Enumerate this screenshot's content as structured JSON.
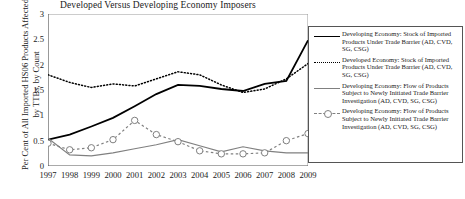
{
  "chart_data": {
    "type": "line",
    "title": "Developed Versus Developing Economy Imposers",
    "xlabel": "",
    "ylabel": "Per Cent of All Imported HS06 Products Affected by TTBs, by Count",
    "x": [
      1997,
      1998,
      1999,
      2000,
      2001,
      2002,
      2003,
      2004,
      2005,
      2006,
      2007,
      2008,
      2009
    ],
    "xlim": [
      1997,
      2009
    ],
    "ylim": [
      0,
      3
    ],
    "yticks": [
      0,
      0.5,
      1,
      1.5,
      2,
      2.5,
      3
    ],
    "ytick_labels": [
      "0",
      "0.5",
      "1",
      "1.5",
      "2",
      "2.5",
      "3"
    ],
    "xtick_labels": [
      "1997",
      "1998",
      "1999",
      "2000",
      "2001",
      "2002",
      "2003",
      "2004",
      "2005",
      "2006",
      "2007",
      "2008",
      "2009"
    ],
    "grid": false,
    "legend_position": "right-outside",
    "series": [
      {
        "name": "Developing Economy: Stock of Imported Products Under Trade Barrier (AD, CVD, SG, CSG)",
        "style": "solid",
        "color": "#000000",
        "marker": "none",
        "values": [
          0.52,
          0.62,
          0.78,
          0.95,
          1.18,
          1.42,
          1.6,
          1.58,
          1.52,
          1.48,
          1.62,
          1.68,
          2.48
        ]
      },
      {
        "name": "Developed Economy: Stock of Imported Products Under Trade Barrier (AD, CVD, SG, CSG)",
        "style": "dotted",
        "color": "#000000",
        "marker": "none",
        "values": [
          1.8,
          1.65,
          1.55,
          1.62,
          1.58,
          1.72,
          1.86,
          1.8,
          1.6,
          1.45,
          1.52,
          1.72,
          2.02
        ]
      },
      {
        "name": "Developing Economy: Flow of Products Subject to Newly Initiated Trade Barrier Investigation (AD, CVD, SG, CSG)",
        "style": "solid",
        "color": "#808080",
        "marker": "none",
        "values": [
          0.55,
          0.22,
          0.2,
          0.26,
          0.34,
          0.42,
          0.52,
          0.4,
          0.28,
          0.38,
          0.3,
          0.26,
          0.26
        ]
      },
      {
        "name": "Developing Economy: Flow of Products Subject to Newly Initiated Trade Barrier Investigation (AD, CVD, SG, CSG)",
        "style": "dashed-circle",
        "color": "#808080",
        "marker": "circle",
        "values": [
          0.45,
          0.32,
          0.36,
          0.52,
          0.9,
          0.62,
          0.48,
          0.3,
          0.24,
          0.24,
          0.26,
          0.5,
          0.64
        ]
      }
    ]
  },
  "legend": {
    "entries": [
      {
        "key": "solid-black",
        "label": "Developing Economy: Stock of Imported Products Under Trade Barrier (AD, CVD, SG, CSG)"
      },
      {
        "key": "dotted-black",
        "label": "Developed Economy: Stock of Imported Products Under Trade Barrier (AD, CVD, SG, CSG)"
      },
      {
        "key": "solid-gray",
        "label": "Developing Economy: Flow of Products Subject to Newly Initiated Trade Barrier Investigation (AD, CVD, SG, CSG)"
      },
      {
        "key": "circle-gray",
        "label": "Developing Economy: Flow of Products Subject to Newly Initiated Trade Barrier Investigation (AD, CVD, SG, CSG)"
      }
    ]
  },
  "colors": {
    "axis": "#555555",
    "series_primary": "#000000",
    "series_secondary": "#808080",
    "background": "#ffffff"
  }
}
